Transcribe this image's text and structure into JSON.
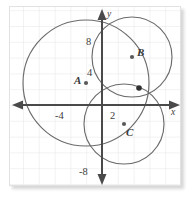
{
  "figure": {
    "background_color": "#ffffff",
    "grid_color": "#e6e6e6",
    "axis_color": "#4a4a4a",
    "curve_color": "#6b6b6b",
    "marker_color": "#5a5a5a"
  },
  "axes": {
    "x_name": "x",
    "y_name": "y",
    "x_tick_labels": [
      "-4",
      "2"
    ],
    "y_tick_labels": [
      "8",
      "4",
      "-8"
    ],
    "origin_px": {
      "x": 102,
      "y": 105
    },
    "unit_px": 15.8
  },
  "chart_data": {
    "type": "scatter",
    "xlabel": "x",
    "ylabel": "y",
    "xlim": [
      -5.6,
      5.0
    ],
    "ylim": [
      -6.2,
      6.3
    ],
    "grid": true,
    "legend": "none",
    "x_ticks": [
      -4,
      2
    ],
    "x_tick_labels": [
      "-4",
      "2"
    ],
    "y_ticks": [
      8,
      4,
      -8
    ],
    "y_tick_labels": [
      "8",
      "4",
      "-8"
    ],
    "tick_note": "Numeric tick labels are printed at half-grid scale (2 grid squares per labelled unit)",
    "circles": [
      {
        "name": "A",
        "label": "A",
        "center": [
          -1.0,
          1.4
        ],
        "center_px": [
          86,
          83
        ],
        "radius": 4.0,
        "radius_px": 63
      },
      {
        "name": "B",
        "label": "B",
        "center": [
          1.9,
          3.05
        ],
        "center_px": [
          132,
          57
        ],
        "radius": 2.55,
        "radius_px": 40
      },
      {
        "name": "C",
        "label": "C",
        "center": [
          1.4,
          -1.2
        ],
        "center_px": [
          124,
          124
        ],
        "radius": 2.55,
        "radius_px": 40
      }
    ],
    "points": [
      {
        "label": "A",
        "at": [
          -1.0,
          1.4
        ],
        "at_px": [
          86,
          83
        ],
        "kind": "center-marker"
      },
      {
        "label": "B",
        "at": [
          1.9,
          3.05
        ],
        "at_px": [
          132,
          57
        ],
        "kind": "center-marker"
      },
      {
        "label": "C",
        "at": [
          1.4,
          -1.2
        ],
        "at_px": [
          124,
          124
        ],
        "kind": "center-marker"
      },
      {
        "label": "",
        "at": [
          2.34,
          1.08
        ],
        "at_px": [
          139,
          88
        ],
        "kind": "intersection"
      }
    ]
  },
  "labels": {
    "y_eight": "8",
    "y_four": "4",
    "y_minus_eight": "-8",
    "x_minus_four": "-4",
    "x_two": "2",
    "axis_x": "x",
    "axis_y": "y",
    "circle_a": "A",
    "circle_b": "B",
    "circle_c": "C"
  }
}
